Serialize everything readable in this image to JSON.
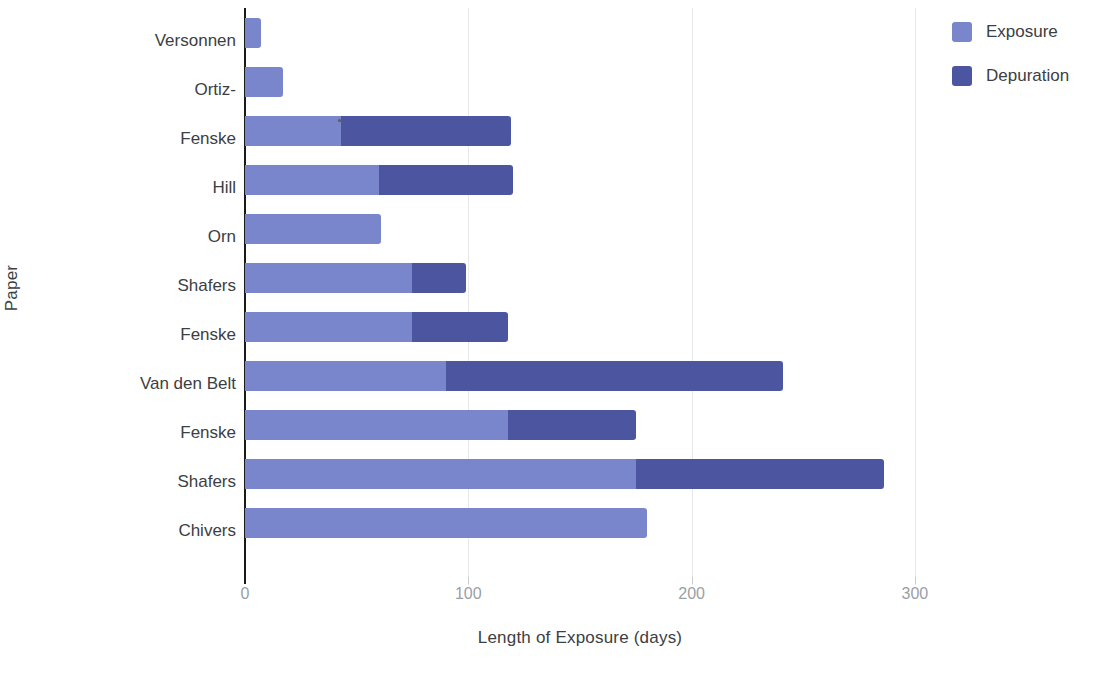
{
  "chart_data": {
    "type": "bar",
    "orientation": "horizontal",
    "stacked": true,
    "title": "",
    "xlabel": "Length of Exposure (days)",
    "ylabel": "Paper",
    "xlim": [
      0,
      301
    ],
    "xticks": [
      0,
      100,
      200,
      300
    ],
    "xtick_labels": [
      "0",
      "100",
      "200",
      "300"
    ],
    "grid": "vertical",
    "legend_position": "top-right",
    "categories": [
      "Versonnen",
      "Ortiz-",
      "Fenske",
      "Hill",
      "Orn",
      "Shafers",
      "Fenske",
      "Van den Belt",
      "Fenske",
      "Shafers",
      "Chivers"
    ],
    "series": [
      {
        "name": "Exposure",
        "color": "#7986cb",
        "values": [
          7,
          17,
          43,
          60,
          61,
          75,
          75,
          90,
          118,
          175,
          180
        ]
      },
      {
        "name": "Depuration",
        "color": "#4c56a0",
        "values": [
          0,
          0,
          76,
          60,
          0,
          24,
          43,
          151,
          57,
          111,
          0
        ]
      }
    ],
    "totals": [
      7,
      17,
      119,
      120,
      61,
      99,
      118,
      241,
      175,
      286,
      180
    ]
  },
  "legend": {
    "items": [
      {
        "label": "Exposure",
        "color": "#7986cb"
      },
      {
        "label": "Depuration",
        "color": "#4c56a0"
      }
    ]
  },
  "axes": {
    "x_title": "Length of Exposure (days)",
    "y_title": "Paper",
    "x_tick_labels": [
      "0",
      "100",
      "200",
      "300"
    ]
  }
}
